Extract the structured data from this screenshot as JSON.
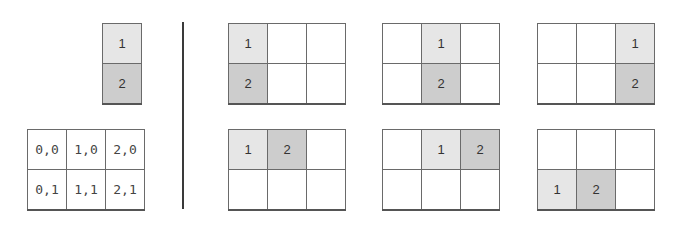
{
  "colors": {
    "item_1_fill": "#e6e6e6",
    "item_2_fill": "#cdcdcd",
    "border": "#6a6a6a",
    "divider": "#3a3a3a"
  },
  "left": {
    "column_shape": {
      "cells": [
        "1",
        "2"
      ]
    },
    "coordinate_grid": {
      "rows": [
        [
          "0,0",
          "1,0",
          "2,0"
        ],
        [
          "0,1",
          "1,1",
          "2,1"
        ]
      ]
    }
  },
  "placements": {
    "vertical": [
      {
        "rows": [
          [
            "1",
            "",
            ""
          ],
          [
            "2",
            "",
            ""
          ]
        ]
      },
      {
        "rows": [
          [
            "",
            "1",
            ""
          ],
          [
            "",
            "2",
            ""
          ]
        ]
      },
      {
        "rows": [
          [
            "",
            "",
            "1"
          ],
          [
            "",
            "",
            "2"
          ]
        ]
      }
    ],
    "horizontal": [
      {
        "rows": [
          [
            "1",
            "2",
            ""
          ],
          [
            "",
            "",
            ""
          ]
        ]
      },
      {
        "rows": [
          [
            "",
            "1",
            "2"
          ],
          [
            "",
            "",
            ""
          ]
        ]
      },
      {
        "rows": [
          [
            "",
            "",
            ""
          ],
          [
            "1",
            "2",
            ""
          ]
        ]
      }
    ]
  }
}
